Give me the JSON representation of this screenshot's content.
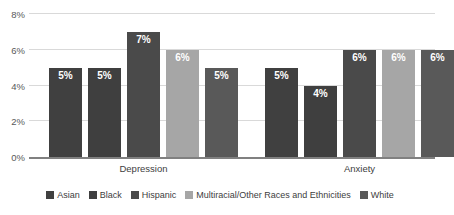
{
  "chart_data": {
    "type": "bar",
    "title": "",
    "subtitle": "",
    "xlabel": "",
    "ylabel": "",
    "categories": [
      "Depression",
      "Anxiety"
    ],
    "series": [
      {
        "name": "Asian",
        "color": "#404040",
        "values": [
          5,
          5
        ],
        "labels": [
          "5%",
          "5%"
        ]
      },
      {
        "name": "Black",
        "color": "#3f3f3f",
        "values": [
          5,
          4
        ],
        "labels": [
          "5%",
          "4%"
        ]
      },
      {
        "name": "Hispanic",
        "color": "#4a4a4a",
        "values": [
          7,
          6
        ],
        "labels": [
          "7%",
          "6%"
        ]
      },
      {
        "name": "Multiracial/Other Races and Ethnicities",
        "color": "#a6a6a6",
        "values": [
          6,
          6
        ],
        "labels": [
          "6%",
          "6%"
        ]
      },
      {
        "name": "White",
        "color": "#595959",
        "values": [
          5,
          6
        ],
        "labels": [
          "5%",
          "6%"
        ]
      }
    ],
    "ylim": [
      0,
      8
    ],
    "yticks": [
      0,
      2,
      4,
      6,
      8
    ],
    "ytick_labels": [
      "0%",
      "2%",
      "4%",
      "6%",
      "8%"
    ],
    "grid": true,
    "legend_position": "bottom",
    "value_labels": true,
    "unit": "%"
  },
  "axis": {
    "ticks": [
      {
        "label": "8%",
        "value": 8
      },
      {
        "label": "6%",
        "value": 6
      },
      {
        "label": "4%",
        "value": 4
      },
      {
        "label": "2%",
        "value": 2
      },
      {
        "label": "0%",
        "value": 0
      }
    ]
  },
  "groups": [
    {
      "label": "Depression",
      "bars": [
        {
          "series": "Asian",
          "label": "5%",
          "value": 5,
          "color": "#404040"
        },
        {
          "series": "Black",
          "label": "5%",
          "value": 5,
          "color": "#3f3f3f"
        },
        {
          "series": "Hispanic",
          "label": "7%",
          "value": 7,
          "color": "#4a4a4a"
        },
        {
          "series": "Multiracial/Other Races and Ethnicities",
          "label": "6%",
          "value": 6,
          "color": "#a6a6a6"
        },
        {
          "series": "White",
          "label": "5%",
          "value": 5,
          "color": "#595959"
        }
      ]
    },
    {
      "label": "Anxiety",
      "bars": [
        {
          "series": "Asian",
          "label": "5%",
          "value": 5,
          "color": "#404040"
        },
        {
          "series": "Black",
          "label": "4%",
          "value": 4,
          "color": "#3f3f3f"
        },
        {
          "series": "Hispanic",
          "label": "6%",
          "value": 6,
          "color": "#4a4a4a"
        },
        {
          "series": "Multiracial/Other Races and Ethnicities",
          "label": "6%",
          "value": 6,
          "color": "#a6a6a6"
        },
        {
          "series": "White",
          "label": "6%",
          "value": 6,
          "color": "#595959"
        }
      ]
    }
  ],
  "legend": {
    "items": [
      {
        "label": "Asian",
        "color": "#404040"
      },
      {
        "label": "Black",
        "color": "#3f3f3f"
      },
      {
        "label": "Hispanic",
        "color": "#4a4a4a"
      },
      {
        "label": "Multiracial/Other Races and Ethnicities",
        "color": "#a6a6a6"
      },
      {
        "label": "White",
        "color": "#595959"
      }
    ]
  },
  "colors": {
    "gridline": "#d9d9d9",
    "baseline": "#808080",
    "tick_text": "#595959",
    "label_text": "#404040",
    "bar_label_text": "#ffffff",
    "background": "#ffffff"
  }
}
